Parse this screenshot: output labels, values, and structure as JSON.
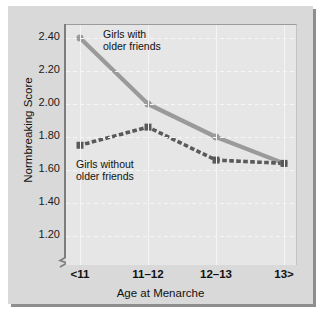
{
  "chart_data": {
    "type": "line",
    "title": "",
    "xlabel": "Age at Menarche",
    "ylabel": "Normbreaking Score",
    "categories": [
      "<11",
      "11–12",
      "12–13",
      "13>"
    ],
    "ylim": [
      1.1,
      2.5
    ],
    "yticks": [
      "2.40",
      "2.20",
      "2.00",
      "1.80",
      "1.60",
      "1.40",
      "1.20"
    ],
    "ytick_values": [
      2.4,
      2.2,
      2.0,
      1.8,
      1.6,
      1.4,
      1.2
    ],
    "axis_break": true,
    "grid": true,
    "legend_position": "inline-annotations",
    "series": [
      {
        "name": "Girls with older friends",
        "style": "solid",
        "color": "#9a9a9a",
        "marker": "circle",
        "values": [
          2.4,
          2.0,
          1.8,
          1.64
        ]
      },
      {
        "name": "Girls without older friends",
        "style": "dotted",
        "color": "#595959",
        "marker": "square",
        "values": [
          1.75,
          1.86,
          1.66,
          1.64
        ]
      }
    ],
    "annotations": [
      {
        "text": "Girls with\nolder friends",
        "series": "Girls with older friends"
      },
      {
        "text": "Girls without\nolder friends",
        "series": "Girls without older friends"
      }
    ]
  },
  "colors": {
    "plot_background": "#e6e6e6",
    "plate_background": "#d9d9d9",
    "grid": "#f4f4f4",
    "axis": "#7d7d7d",
    "series_solid": "#9a9a9a",
    "series_dotted": "#595959",
    "text": "#111111"
  }
}
